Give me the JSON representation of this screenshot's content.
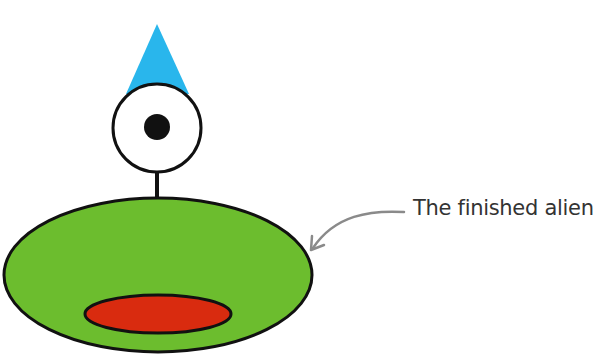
{
  "figure": {
    "caption": "The finished alien",
    "colors": {
      "hat": "#29b6ec",
      "eye_white": "#ffffff",
      "pupil": "#111111",
      "outline": "#111111",
      "body": "#6cbd2e",
      "mouth": "#d92b0f",
      "arrow": "#8a8a8a",
      "caption_text": "#333333"
    },
    "parts": [
      "hat",
      "eye",
      "pupil",
      "neck",
      "body",
      "mouth",
      "arrow"
    ]
  }
}
